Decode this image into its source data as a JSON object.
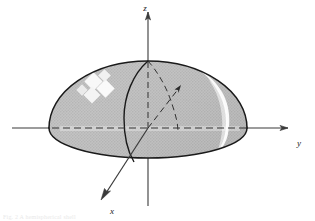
{
  "figure": {
    "caption": "Fig. 2  A hemispherical shell",
    "background_color": "#ffffff",
    "line_color": "#1a1a1a",
    "surface_fill": "#b7b7b7",
    "surface_fill_light": "#c9c9c9",
    "highlight_color": "#ffffff",
    "axes": [
      {
        "name": "z",
        "label": "z",
        "direction": "up",
        "label_x": 146,
        "label_y": 10
      },
      {
        "name": "y",
        "label": "y",
        "direction": "right",
        "label_x": 299,
        "label_y": 146
      },
      {
        "name": "x",
        "label": "x",
        "direction": "down-left",
        "label_x": 112,
        "label_y": 214
      }
    ],
    "origin": {
      "x": 148,
      "y": 128
    },
    "solid": {
      "kind": "hemisphere",
      "apex": {
        "x": 148,
        "y": 61
      },
      "radius_x": 99,
      "radius_y": 67,
      "equator_rx": 99,
      "equator_ry": 30,
      "left_edge_x": 49,
      "right_edge_x": 247
    },
    "features": [
      {
        "name": "equator-ellipse",
        "style": "dashed-front-solid-back"
      },
      {
        "name": "great-circle-vertical",
        "style": "solid"
      },
      {
        "name": "great-circle-dashed",
        "style": "dashed"
      },
      {
        "name": "sparkle-highlight",
        "position": "upper-left"
      },
      {
        "name": "specular-streak",
        "position": "right"
      }
    ]
  }
}
